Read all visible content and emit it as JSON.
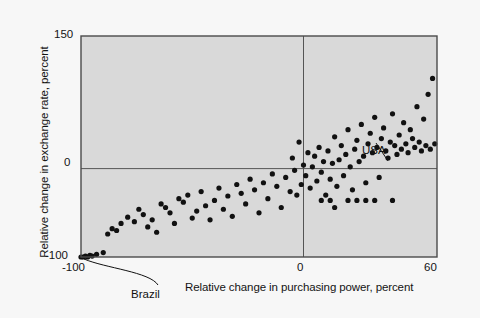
{
  "figure": {
    "background_color": "#f7f7f7",
    "plot_background_color": "#d9d9d9",
    "frame_color": "#4a4a4a",
    "point_color": "#111111"
  },
  "axes": {
    "y_title": "Relative change in exchange rate, percent",
    "x_title": "Relative change in purchasing power, percent",
    "y_ticks": [
      "150",
      "0",
      "-100"
    ],
    "x_ticks": [
      "-100",
      "0",
      "60"
    ]
  },
  "annotations": [
    {
      "label": "Brazil",
      "x": -100,
      "y": -100
    },
    {
      "label": "USA",
      "x": 38,
      "y": 12
    }
  ],
  "chart_data": {
    "type": "scatter",
    "title": "",
    "xlabel": "Relative change in purchasing power, percent",
    "ylabel": "Relative change in exchange rate, percent",
    "xlim": [
      -100,
      60
    ],
    "ylim": [
      -100,
      150
    ],
    "xticks": [
      -100,
      0,
      60
    ],
    "yticks": [
      -100,
      0,
      150
    ],
    "grid": false,
    "zero_lines": {
      "x": 0,
      "y": 0
    },
    "legend": null,
    "series": [
      {
        "name": "Countries",
        "marker": "filled-circle",
        "color": "#111111",
        "points": [
          [
            -100,
            -100
          ],
          [
            -99,
            -100
          ],
          [
            -98,
            -99
          ],
          [
            -97,
            -100
          ],
          [
            -96,
            -98
          ],
          [
            -95,
            -99
          ],
          [
            -93,
            -97
          ],
          [
            -90,
            -95
          ],
          [
            -88,
            -74
          ],
          [
            -86,
            -68
          ],
          [
            -84,
            -70
          ],
          [
            -82,
            -62
          ],
          [
            -79,
            -55
          ],
          [
            -76,
            -60
          ],
          [
            -74,
            -46
          ],
          [
            -72,
            -52
          ],
          [
            -70,
            -66
          ],
          [
            -68,
            -58
          ],
          [
            -66,
            -72
          ],
          [
            -64,
            -40
          ],
          [
            -62,
            -44
          ],
          [
            -60,
            -50
          ],
          [
            -58,
            -62
          ],
          [
            -56,
            -34
          ],
          [
            -54,
            -38
          ],
          [
            -52,
            -30
          ],
          [
            -50,
            -56
          ],
          [
            -48,
            -48
          ],
          [
            -46,
            -26
          ],
          [
            -44,
            -42
          ],
          [
            -42,
            -58
          ],
          [
            -40,
            -36
          ],
          [
            -38,
            -22
          ],
          [
            -36,
            -46
          ],
          [
            -34,
            -31
          ],
          [
            -32,
            -54
          ],
          [
            -30,
            -18
          ],
          [
            -28,
            -28
          ],
          [
            -26,
            -40
          ],
          [
            -24,
            -12
          ],
          [
            -22,
            -24
          ],
          [
            -20,
            -50
          ],
          [
            -18,
            -16
          ],
          [
            -16,
            -34
          ],
          [
            -14,
            -6
          ],
          [
            -12,
            -20
          ],
          [
            -10,
            -44
          ],
          [
            -8,
            -10
          ],
          [
            -6,
            -26
          ],
          [
            -5,
            12
          ],
          [
            -4,
            -2
          ],
          [
            -3,
            -30
          ],
          [
            -2,
            30
          ],
          [
            -1,
            -18
          ],
          [
            0,
            4
          ],
          [
            1,
            -8
          ],
          [
            2,
            18
          ],
          [
            3,
            -22
          ],
          [
            4,
            2
          ],
          [
            5,
            14
          ],
          [
            6,
            -14
          ],
          [
            7,
            24
          ],
          [
            8,
            -4
          ],
          [
            9,
            8
          ],
          [
            10,
            -30
          ],
          [
            11,
            20
          ],
          [
            12,
            -12
          ],
          [
            13,
            6
          ],
          [
            14,
            36
          ],
          [
            15,
            -20
          ],
          [
            16,
            10
          ],
          [
            17,
            26
          ],
          [
            18,
            -8
          ],
          [
            19,
            16
          ],
          [
            20,
            44
          ],
          [
            21,
            2
          ],
          [
            22,
            -24
          ],
          [
            23,
            22
          ],
          [
            24,
            32
          ],
          [
            25,
            8
          ],
          [
            26,
            50
          ],
          [
            27,
            14
          ],
          [
            28,
            -16
          ],
          [
            29,
            28
          ],
          [
            30,
            40
          ],
          [
            31,
            18
          ],
          [
            32,
            58
          ],
          [
            33,
            24
          ],
          [
            34,
            -10
          ],
          [
            35,
            34
          ],
          [
            36,
            46
          ],
          [
            37,
            20
          ],
          [
            38,
            12
          ],
          [
            39,
            30
          ],
          [
            40,
            62
          ],
          [
            41,
            26
          ],
          [
            42,
            16
          ],
          [
            43,
            38
          ],
          [
            44,
            22
          ],
          [
            45,
            52
          ],
          [
            46,
            28
          ],
          [
            47,
            18
          ],
          [
            48,
            44
          ],
          [
            49,
            34
          ],
          [
            50,
            24
          ],
          [
            51,
            70
          ],
          [
            52,
            30
          ],
          [
            53,
            20
          ],
          [
            54,
            56
          ],
          [
            55,
            26
          ],
          [
            56,
            84
          ],
          [
            57,
            22
          ],
          [
            58,
            102
          ],
          [
            59,
            28
          ],
          [
            20,
            -36
          ],
          [
            24,
            -36
          ],
          [
            28,
            -36
          ],
          [
            32,
            -36
          ],
          [
            40,
            -36
          ],
          [
            8,
            -36
          ],
          [
            12,
            -36
          ],
          [
            14,
            -44
          ]
        ]
      }
    ]
  }
}
